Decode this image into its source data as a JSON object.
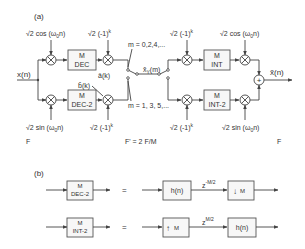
{
  "part_a": {
    "label": "(a)",
    "input_label": "x(n)",
    "output_label": "x̃(n)",
    "rate_left": "F",
    "rate_mid": "F' = 2 F/M",
    "rate_right": "F",
    "top_left_mixer_signal": "√2 cos (ω₀n)",
    "top_left_mixer_signal_parts": {
      "sqrt": "√",
      "body": "2 cos (ω",
      "sub": "0",
      "tail": "n)"
    },
    "bottom_left_mixer_signal_parts": {
      "sqrt": "√",
      "body": "2 sin (ω",
      "sub": "0",
      "tail": "n)"
    },
    "top_mid_mixer_signal_parts": {
      "sqrt": "√",
      "body": "2 (-1)",
      "sup": "k"
    },
    "bottom_mid_mixer_signal_parts": {
      "sqrt": "√",
      "body": "2 (-1)",
      "sup": "k"
    },
    "top_right_mixer1_signal_parts": {
      "sqrt": "√",
      "body": "2 (-1)",
      "sup": "k"
    },
    "bottom_right_mixer1_signal_parts": {
      "sqrt": "√",
      "body": "2 (-1)",
      "sup": "k"
    },
    "top_right_mixer2_signal_parts": {
      "sqrt": "√",
      "body": "2 cos (ω",
      "sub": "0",
      "tail": "n)"
    },
    "bottom_right_mixer2_signal_parts": {
      "sqrt": "√",
      "body": "2 sin (ω",
      "sub": "0",
      "tail": "n)"
    },
    "blocks": {
      "dec_top": {
        "line1": "M",
        "line2": "DEC"
      },
      "dec_bottom": {
        "line1": "M",
        "line2": "DEC-2"
      },
      "int_top": {
        "line1": "M",
        "line2": "INT"
      },
      "int_bottom": {
        "line1": "M",
        "line2": "INT-2"
      }
    },
    "a_k_label": "â(k)",
    "b_k_label": "b̂(k)",
    "switch_even": "m = 0,2,4,...",
    "switch_odd": "m = 1, 3, 5,...",
    "channel_label": "x̂",
    "channel_sub": "Y",
    "channel_tail": "(m)",
    "adder_symbol": "+"
  },
  "part_b": {
    "label": "(b)",
    "equals": "=",
    "row1": {
      "lhs": {
        "line1": "M",
        "line2": "DEC-2"
      },
      "filter": "h(n)",
      "delay": "z",
      "delay_exp": "-M/2",
      "downsample": "M",
      "downsample_arrow": "↓"
    },
    "row2": {
      "lhs": {
        "line1": "M",
        "line2": "INT-2"
      },
      "upsample": "M",
      "upsample_arrow": "↑",
      "delay": "z",
      "delay_exp": "M/2",
      "filter": "h(n)"
    }
  }
}
